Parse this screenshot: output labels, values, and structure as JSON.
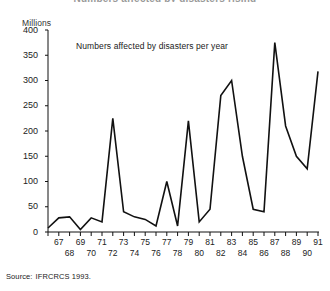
{
  "top_headline": "Numbers affected by disasters rising",
  "caption": "Numbers affected by disasters per year",
  "unit_label": "Millions",
  "source": {
    "label": "Source:",
    "text": "IFRCRCS 1993."
  },
  "chart_data": {
    "type": "line",
    "title": "Numbers affected by disasters per year",
    "xlabel": "",
    "ylabel": "Millions",
    "ylim": [
      0,
      400
    ],
    "yticks": [
      0,
      50,
      100,
      150,
      200,
      250,
      300,
      350,
      400
    ],
    "grid": false,
    "legend": null,
    "line_color": "#111111",
    "categories": [
      "66",
      "67",
      "68",
      "69",
      "70",
      "71",
      "72",
      "73",
      "74",
      "75",
      "76",
      "77",
      "78",
      "79",
      "80",
      "81",
      "82",
      "83",
      "84",
      "85",
      "86",
      "87",
      "88",
      "89",
      "90",
      "91"
    ],
    "x": [
      1966,
      1967,
      1968,
      1969,
      1970,
      1971,
      1972,
      1973,
      1974,
      1975,
      1976,
      1977,
      1978,
      1979,
      1980,
      1981,
      1982,
      1983,
      1984,
      1985,
      1986,
      1987,
      1988,
      1989,
      1990,
      1991
    ],
    "values": [
      8,
      28,
      30,
      5,
      28,
      20,
      225,
      40,
      30,
      25,
      12,
      100,
      12,
      220,
      20,
      45,
      270,
      300,
      150,
      45,
      40,
      375,
      210,
      150,
      125,
      318
    ],
    "annotations": [
      {
        "text": "Numbers affected by disasters per year",
        "x": 1971,
        "y": 355
      }
    ],
    "axis_tick_years_top": [
      "67",
      "69",
      "71",
      "73",
      "75",
      "77",
      "79",
      "81",
      "83",
      "85",
      "87",
      "89",
      "91"
    ],
    "axis_tick_years_bottom": [
      "68",
      "70",
      "72",
      "74",
      "76",
      "78",
      "80",
      "82",
      "84",
      "86",
      "88",
      "90"
    ]
  }
}
